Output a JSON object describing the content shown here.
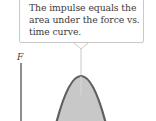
{
  "callout": {
    "lines": [
      "The impulse equals the",
      "area under the force vs.",
      "time curve."
    ]
  },
  "axis": {
    "y_label": "F"
  },
  "colors": {
    "curve_stroke": "#5e5e5e",
    "curve_fill": "#c8c8c8",
    "callout_border": "#c9c9c9",
    "text": "#3c3c3c",
    "axis": "#444444"
  }
}
